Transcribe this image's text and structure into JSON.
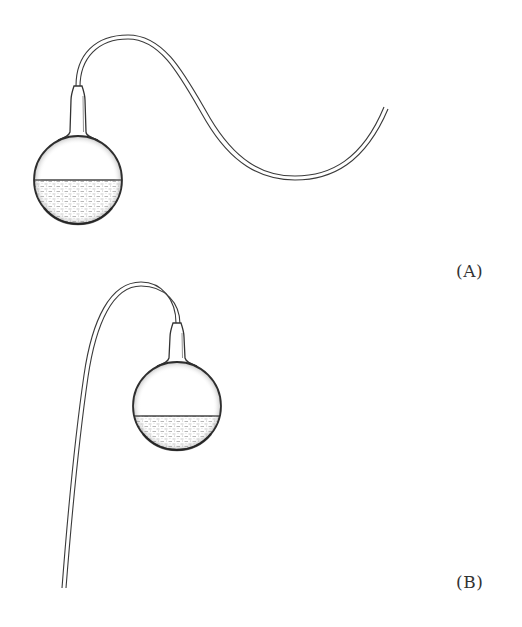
{
  "figure": {
    "panels": [
      {
        "id": "A",
        "label": "(A)",
        "description": "Round-bottom flask, half filled with liquid, with a long narrow neck bent into an S-shaped swan-neck tube that rises, then curves down and up again to an open end",
        "liquid_level": "half"
      },
      {
        "id": "B",
        "label": "(B)",
        "description": "Round-bottom flask, half filled with liquid, with neck bent into a hook-shaped tube that arcs over and descends straight down to an open end",
        "liquid_level": "half"
      }
    ],
    "colors": {
      "line": "#333333",
      "liquid_stipple": "#8a8a8a",
      "background": "#ffffff"
    }
  }
}
